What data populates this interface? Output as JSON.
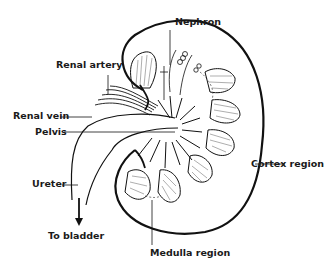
{
  "labels": {
    "nephron": "Nephron",
    "renal_artery": "Renal artery",
    "renal_vein": "Renal vein",
    "pelvis": "Pelvis",
    "cortex_region": "Cortex region",
    "ureter": "Ureter",
    "to_bladder": "To bladder",
    "medulla_region": "Medulla region"
  },
  "colors": {
    "ink": "#111111",
    "background": "#ffffff"
  }
}
